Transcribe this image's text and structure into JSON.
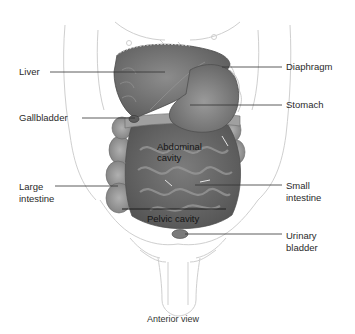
{
  "figure": {
    "view_caption": "Anterior view",
    "labels": {
      "left": [
        {
          "id": "liver",
          "text": "Liver"
        },
        {
          "id": "gallbladder",
          "text": "Gallbladder"
        },
        {
          "id": "large_intestine",
          "line1": "Large",
          "line2": "intestine"
        }
      ],
      "right": [
        {
          "id": "diaphragm",
          "text": "Diaphragm"
        },
        {
          "id": "stomach",
          "text": "Stomach"
        },
        {
          "id": "small_intestine",
          "line1": "Small",
          "line2": "intestine"
        },
        {
          "id": "urinary_bladder",
          "line1": "Urinary",
          "line2": "bladder"
        }
      ],
      "inner": {
        "abdominal_line1": "Abdominal",
        "abdominal_line2": "cavity",
        "pelvic": "Pelvic cavity"
      }
    },
    "colors": {
      "outline": "#c8c8c8",
      "organ_dark": "#6e6e6e",
      "organ_mid": "#8a8a8a",
      "organ_light": "#a9a9a9",
      "leader_line": "#333333"
    }
  }
}
